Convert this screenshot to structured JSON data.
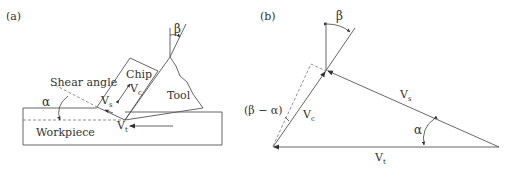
{
  "figure": {
    "panel_a": {
      "label": "(a)",
      "shear_angle_label": "Shear angle",
      "chip_label": "Chip",
      "tool_label": "Tool",
      "workpiece_label": "Workpiece",
      "alpha": "α",
      "beta": "β",
      "vs": {
        "main": "V",
        "sub": "s"
      },
      "vc": {
        "main": "V",
        "sub": "c"
      },
      "vt": {
        "main": "V",
        "sub": "t"
      }
    },
    "panel_b": {
      "label": "(b)",
      "beta": "β",
      "alpha": "α",
      "beta_minus_alpha": "(β − α)",
      "vs": {
        "main": "V",
        "sub": "s"
      },
      "vc": {
        "main": "V",
        "sub": "c"
      },
      "vt": {
        "main": "V",
        "sub": "t"
      }
    }
  },
  "colors": {
    "line": "#555555",
    "text": "#333333",
    "background": "#ffffff"
  }
}
